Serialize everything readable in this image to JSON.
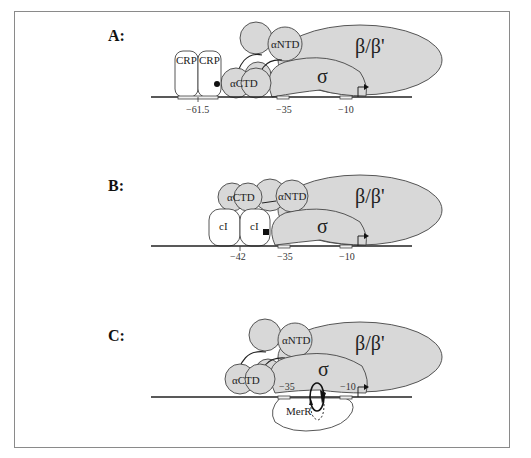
{
  "figure": {
    "panels": [
      {
        "label": "A:",
        "proteins": {
          "crp1": "CRP",
          "crp2": "CRP",
          "actd": "αCTD",
          "antd": "αNTD",
          "sigma": "σ",
          "beta": "β/β'"
        },
        "positions": [
          "−61.5",
          "−35",
          "−10"
        ]
      },
      {
        "label": "B:",
        "proteins": {
          "ci1": "cI",
          "ci2": "cI",
          "actd": "αCTD",
          "antd": "αNTD",
          "sigma": "σ",
          "beta": "β/β'"
        },
        "positions": [
          "−42",
          "−35",
          "−10"
        ]
      },
      {
        "label": "C:",
        "proteins": {
          "merr": "MerR",
          "actd": "αCTD",
          "antd": "αNTD",
          "sigma": "σ",
          "beta": "β/β'"
        },
        "positions": [
          "−35",
          "−10"
        ]
      }
    ],
    "colors": {
      "rnap_fill": "#d8d8d8",
      "activator_fill": "#ffffff",
      "outline": "#444444"
    }
  }
}
